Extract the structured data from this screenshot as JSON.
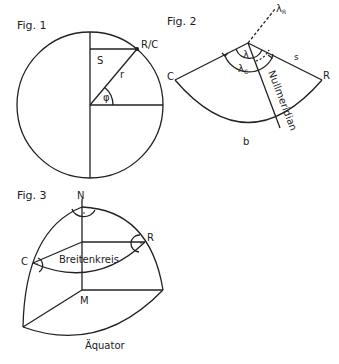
{
  "fig1": {
    "title": "Fig. 1",
    "labels": {
      "point": "R/C",
      "chord": "S",
      "radius": "r",
      "angle": "φ"
    }
  },
  "fig2": {
    "title": "Fig. 2",
    "labels": {
      "left": "C",
      "right": "R",
      "arc": "b",
      "side": "s",
      "lambda": "λ",
      "lambda_c": "λ",
      "lambda_c_sub": "C",
      "lambda_r": "λ",
      "lambda_r_sub": "R",
      "meridian": "Nullmeridian"
    }
  },
  "fig3": {
    "title": "Fig. 3",
    "labels": {
      "north": "N",
      "center": "M",
      "left": "C",
      "right": "R",
      "latitude_circle": "Breitenkreis",
      "equator": "Äquator"
    }
  },
  "colors": {
    "stroke": "#222222",
    "background": "#ffffff"
  }
}
